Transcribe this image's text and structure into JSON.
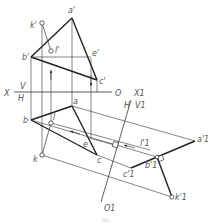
{
  "figure": {
    "caption": "(b)",
    "colors": {
      "thick": "#222222",
      "thin": "#333333",
      "label": "#555555",
      "background": "#ffffff"
    }
  },
  "axes": {
    "x_axis": {
      "left_label": "X",
      "upper_label": "V",
      "lower_label": "H",
      "end_label": "O"
    },
    "x1_axis": {
      "label": "X1",
      "upper_left_label": "H",
      "upper_right_label": "V1",
      "end_label": "O1"
    }
  },
  "frontal_view": {
    "points": [
      {
        "name": "a'",
        "x": 72,
        "y": 18
      },
      {
        "name": "b'",
        "x": 31,
        "y": 57
      },
      {
        "name": "c'",
        "x": 97,
        "y": 80
      },
      {
        "name": "e'",
        "x": 91,
        "y": 58
      },
      {
        "name": "k'",
        "x": 42,
        "y": 23
      },
      {
        "name": "l'",
        "x": 51,
        "y": 51
      }
    ]
  },
  "top_view": {
    "points": [
      {
        "name": "a",
        "x": 72,
        "y": 106
      },
      {
        "name": "b",
        "x": 31,
        "y": 120
      },
      {
        "name": "c",
        "x": 97,
        "y": 155
      },
      {
        "name": "e",
        "x": 89,
        "y": 138
      },
      {
        "name": "l",
        "x": 51,
        "y": 123
      },
      {
        "name": "k",
        "x": 42,
        "y": 155
      }
    ]
  },
  "auxiliary_view": {
    "points": [
      {
        "name": "a'1",
        "x": 195,
        "y": 141
      },
      {
        "name": "b'1",
        "x": 157,
        "y": 157
      },
      {
        "name": "c'1",
        "x": 131,
        "y": 168
      },
      {
        "name": "k'1",
        "x": 172,
        "y": 197
      },
      {
        "name": "l'1",
        "x": 150,
        "y": 145
      }
    ]
  }
}
